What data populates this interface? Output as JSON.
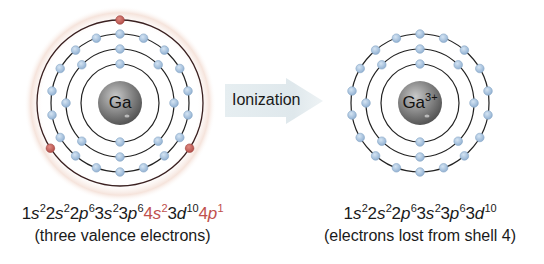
{
  "colors": {
    "electron": "#a9c4e0",
    "electron_stroke": "#7f9fc0",
    "valence_electron": "#c0504d",
    "orbit": "#2b2b2b",
    "outer_orbit": "#5a3030",
    "nucleus": "#8a8a8a",
    "arrow_fill": "#e3ebee",
    "highlight_text": "#c0504d",
    "glow": "#f6e3db"
  },
  "arrow": {
    "label": "Ionization"
  },
  "left_atom": {
    "nucleus_label": "Ga",
    "center": [
      120,
      103
    ],
    "shells": [
      {
        "shell": 1,
        "radius": 39,
        "electrons": 2,
        "valence": false
      },
      {
        "shell": 2,
        "radius": 54,
        "electrons": 8,
        "valence": false
      },
      {
        "shell": 3,
        "radius": 69,
        "electrons": 18,
        "valence": false
      },
      {
        "shell": 4,
        "radius": 83,
        "electrons": 3,
        "valence": true
      }
    ],
    "config_parts": [
      {
        "base": "1",
        "orb": "s",
        "sup": "2",
        "hl": false
      },
      {
        "base": "2",
        "orb": "s",
        "sup": "2",
        "hl": false
      },
      {
        "base": "2",
        "orb": "p",
        "sup": "6",
        "hl": false
      },
      {
        "base": "3",
        "orb": "s",
        "sup": "2",
        "hl": false
      },
      {
        "base": "3",
        "orb": "p",
        "sup": "6",
        "hl": false
      },
      {
        "base": "4",
        "orb": "s",
        "sup": "2",
        "hl": true
      },
      {
        "base": "3",
        "orb": "d",
        "sup": "10",
        "hl": false
      },
      {
        "base": "4",
        "orb": "p",
        "sup": "1",
        "hl": true
      }
    ],
    "caption": "(three valence electrons)"
  },
  "right_atom": {
    "nucleus_label": "Ga",
    "nucleus_charge": "3+",
    "center": [
      420,
      103
    ],
    "shells": [
      {
        "shell": 1,
        "radius": 39,
        "electrons": 2,
        "valence": false
      },
      {
        "shell": 2,
        "radius": 54,
        "electrons": 8,
        "valence": false
      },
      {
        "shell": 3,
        "radius": 69,
        "electrons": 18,
        "valence": false
      }
    ],
    "config_parts": [
      {
        "base": "1",
        "orb": "s",
        "sup": "2",
        "hl": false
      },
      {
        "base": "2",
        "orb": "s",
        "sup": "2",
        "hl": false
      },
      {
        "base": "2",
        "orb": "p",
        "sup": "6",
        "hl": false
      },
      {
        "base": "3",
        "orb": "s",
        "sup": "2",
        "hl": false
      },
      {
        "base": "3",
        "orb": "p",
        "sup": "6",
        "hl": false
      },
      {
        "base": "3",
        "orb": "d",
        "sup": "10",
        "hl": false
      }
    ],
    "caption": "(electrons lost from shell 4)"
  }
}
